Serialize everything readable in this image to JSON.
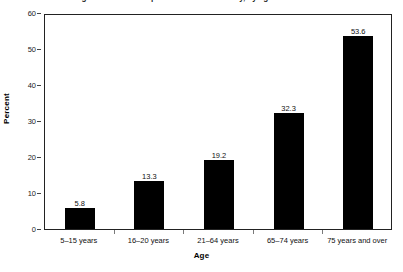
{
  "chart_data": {
    "type": "bar",
    "title": "",
    "categories": [
      "5–15 years",
      "16–20 years",
      "21–64 years",
      "65–74 years",
      "75 years and over"
    ],
    "values": [
      5.8,
      13.3,
      19.2,
      32.3,
      53.6
    ],
    "value_labels": [
      "5.8",
      "13.3",
      "19.2",
      "32.3",
      "53.6"
    ],
    "xlabel": "Age",
    "ylabel": "Percent",
    "ylim": [
      0,
      60
    ],
    "yticks": [
      60,
      50,
      40,
      30,
      20,
      10,
      0
    ],
    "ytick_labels": [
      "60",
      "50",
      "40",
      "30",
      "20",
      "10",
      "0"
    ],
    "grid": false,
    "legend": null,
    "bar_color": "#000000",
    "frame_color": "#222222"
  },
  "figure": {
    "title_clipped": "Figure 1. Percent of persons with a disability, by age: United States"
  }
}
